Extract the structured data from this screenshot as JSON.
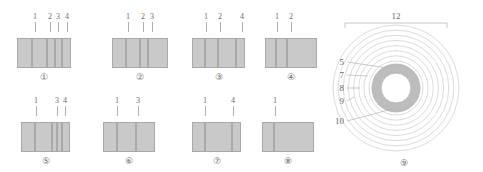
{
  "figure": {
    "title": "",
    "colors": {
      "bar_fill": "#c9c9c9",
      "bar_stroke": "#a9a9a9",
      "ring_fill": "#b9b9b9",
      "line": "#c0c0c0",
      "text": "#666666"
    },
    "bar_groups": [
      {
        "caption": "①",
        "left": 17,
        "top": 12,
        "bars": [
          {
            "w": 15,
            "h": 30
          },
          {
            "w": 15,
            "h": 30
          },
          {
            "w": 8,
            "h": 30
          },
          {
            "w": 7,
            "h": 30
          },
          {
            "w": 9,
            "h": 30
          }
        ],
        "labels": [
          {
            "text": "1",
            "x": 18,
            "leader_h": 10
          },
          {
            "text": "2",
            "x": 33,
            "leader_h": 10
          },
          {
            "text": "3",
            "x": 41,
            "leader_h": 10
          },
          {
            "text": "4",
            "x": 50,
            "leader_h": 10
          }
        ]
      },
      {
        "caption": "②",
        "left": 112,
        "top": 12,
        "bars": [
          {
            "w": 14,
            "h": 30
          },
          {
            "w": 14,
            "h": 30
          },
          {
            "w": 8,
            "h": 30
          },
          {
            "w": 20,
            "h": 30
          }
        ],
        "labels": [
          {
            "text": "1",
            "x": 16,
            "leader_h": 10
          },
          {
            "text": "2",
            "x": 31,
            "leader_h": 10
          },
          {
            "text": "3",
            "x": 40,
            "leader_h": 10
          }
        ]
      },
      {
        "caption": "③",
        "left": 192,
        "top": 12,
        "bars": [
          {
            "w": 13,
            "h": 30
          },
          {
            "w": 13,
            "h": 30
          },
          {
            "w": 18,
            "h": 30
          },
          {
            "w": 9,
            "h": 30
          }
        ],
        "labels": [
          {
            "text": "1",
            "x": 14,
            "leader_h": 10
          },
          {
            "text": "2",
            "x": 28,
            "leader_h": 10
          },
          {
            "text": "4",
            "x": 50,
            "leader_h": 10
          }
        ]
      },
      {
        "caption": "④",
        "left": 265,
        "top": 12,
        "bars": [
          {
            "w": 11,
            "h": 30
          },
          {
            "w": 11,
            "h": 30
          },
          {
            "w": 30,
            "h": 30
          }
        ],
        "labels": [
          {
            "text": "1",
            "x": 12,
            "leader_h": 10
          },
          {
            "text": "2",
            "x": 26,
            "leader_h": 10
          }
        ]
      },
      {
        "caption": "⑤",
        "left": 21,
        "top": 96,
        "bars": [
          {
            "w": 14,
            "h": 30
          },
          {
            "w": 17,
            "h": 30
          },
          {
            "w": 5,
            "h": 30
          },
          {
            "w": 5,
            "h": 30
          },
          {
            "w": 8,
            "h": 30
          }
        ],
        "labels": [
          {
            "text": "1",
            "x": 15,
            "leader_h": 10
          },
          {
            "text": "3",
            "x": 36,
            "leader_h": 10
          },
          {
            "text": "4",
            "x": 44,
            "leader_h": 10
          }
        ]
      },
      {
        "caption": "⑥",
        "left": 103,
        "top": 96,
        "bars": [
          {
            "w": 14,
            "h": 30
          },
          {
            "w": 19,
            "h": 30
          },
          {
            "w": 19,
            "h": 30
          }
        ],
        "labels": [
          {
            "text": "1",
            "x": 14,
            "leader_h": 10
          },
          {
            "text": "3",
            "x": 35,
            "leader_h": 10
          }
        ]
      },
      {
        "caption": "⑦",
        "left": 192,
        "top": 96,
        "bars": [
          {
            "w": 13,
            "h": 30
          },
          {
            "w": 27,
            "h": 30
          },
          {
            "w": 9,
            "h": 30
          }
        ],
        "labels": [
          {
            "text": "1",
            "x": 13,
            "leader_h": 10
          },
          {
            "text": "4",
            "x": 41,
            "leader_h": 10
          }
        ]
      },
      {
        "caption": "⑧",
        "left": 262,
        "top": 96,
        "bars": [
          {
            "w": 12,
            "h": 30
          },
          {
            "w": 40,
            "h": 30
          }
        ],
        "labels": [
          {
            "text": "1",
            "x": 13,
            "leader_h": 10
          }
        ]
      }
    ],
    "circle_diagram": {
      "caption": "⑨",
      "span_label": "12",
      "callouts": [
        {
          "text": "5",
          "y": 58
        },
        {
          "text": "7",
          "y": 71
        },
        {
          "text": "8",
          "y": 84
        },
        {
          "text": "9",
          "y": 97
        },
        {
          "text": "10",
          "y": 117
        }
      ],
      "ring_count": 8
    }
  }
}
